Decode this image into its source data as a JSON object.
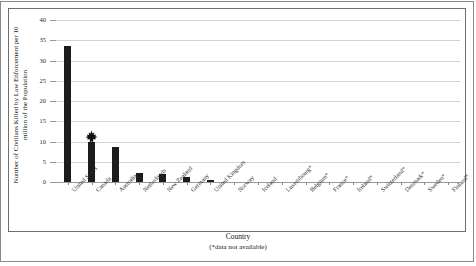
{
  "chart_data": {
    "type": "bar",
    "title": "",
    "xlabel": "Country",
    "xlabel_note": "(*data not available)",
    "ylabel_line1": "Number of Civilians Killed by Law Enforcement per 10",
    "ylabel_line2": "million of the Population",
    "ylim": [
      0,
      40
    ],
    "ytick_values": [
      0,
      5,
      10,
      15,
      20,
      25,
      30,
      35,
      40
    ],
    "ytick_labels": [
      "0",
      "5",
      "10",
      "15",
      "20",
      "25",
      "30",
      "35",
      "40"
    ],
    "grid": true,
    "legend": "none",
    "bar_color": "#1c1c1c",
    "categories": [
      "United States",
      "Canada",
      "Australia",
      "Netherlands",
      "New Zealand",
      "Germany",
      "United Kingdom",
      "Norway",
      "Iceland",
      "Luxembourg*",
      "Belgium*",
      "France*",
      "Ireland*",
      "Switzerland*",
      "Denmark*",
      "Sweden*",
      "Finland*"
    ],
    "values": [
      33.5,
      9.8,
      8.6,
      2.2,
      2.0,
      1.3,
      0.5,
      0,
      0,
      0,
      0,
      0,
      0,
      0,
      0,
      0,
      0
    ],
    "annotations": [
      {
        "name": "maple-leaf-marker",
        "category": "Canada",
        "symbol": "maple-leaf"
      }
    ]
  }
}
